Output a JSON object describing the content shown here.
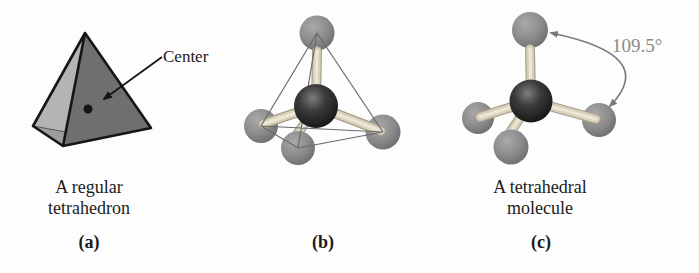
{
  "figure": {
    "panels": {
      "a": {
        "caption": "A regular tetrahedron",
        "tag": "(a)",
        "annotation": "Center"
      },
      "b": {
        "tag": "(b)"
      },
      "c": {
        "caption": "A tetrahedral molecule",
        "tag": "(c)",
        "angle_label": "109.5°"
      }
    },
    "colors": {
      "background": "#fdfdfd",
      "face-light": "#b4b4b4",
      "face-dark": "#6f6f6f",
      "face-bottom": "#9c9c9c",
      "edge-dark": "#161616",
      "thin-line": "#6a6a6a",
      "bond-edge": "#a89f8b",
      "bond-fill": "#d8d0ba",
      "bond-highlight": "#ece7d6",
      "arrow-gray": "#7a7a7a",
      "text": "#1b1b1b",
      "angle-text": "#8a8a8a"
    }
  }
}
